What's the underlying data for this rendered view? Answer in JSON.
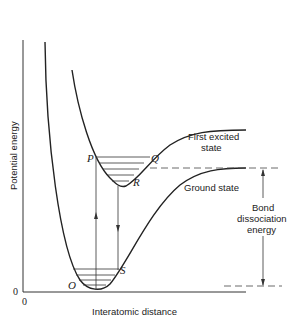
{
  "diagram": {
    "type": "potential-energy-curves",
    "axes": {
      "ylabel": "Potential energy",
      "xlabel": "Interatomic distance",
      "y_origin_label": "0",
      "x_origin_label": "0"
    },
    "curves": [
      {
        "name": "Ground state",
        "label": "Ground state"
      },
      {
        "name": "First excited state",
        "label_line1": "First excited",
        "label_line2": "state"
      }
    ],
    "points": {
      "P": "P",
      "Q": "Q",
      "R": "R",
      "S": "S",
      "O": "O"
    },
    "annotation": {
      "line1": "Bond",
      "line2": "dissociation",
      "line3": "energy"
    },
    "colors": {
      "ink": "#222222",
      "background": "#ffffff"
    }
  }
}
